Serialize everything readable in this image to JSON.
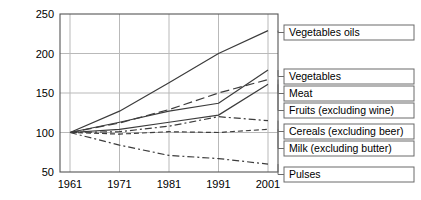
{
  "chart_data": {
    "type": "line",
    "title": "",
    "subtitle": "",
    "xlabel": "",
    "ylabel": "",
    "x": [
      1961,
      1971,
      1981,
      1991,
      2001
    ],
    "xtick_labels": [
      "1961",
      "1971",
      "1981",
      "1991",
      "2001"
    ],
    "xlim": [
      1961,
      2001
    ],
    "ylim": [
      50,
      250
    ],
    "ytick_labels": [
      "50",
      "100",
      "150",
      "200",
      "250"
    ],
    "yticks": [
      50,
      100,
      150,
      200,
      250
    ],
    "grid": true,
    "legend_position": "right-callout-boxes",
    "index_base": 100,
    "series": [
      {
        "name": "Vegetables oils",
        "label": "Vegetables oils",
        "values": [
          100,
          127,
          163,
          200,
          229
        ],
        "dash": "solid",
        "color": "#3c3c3c"
      },
      {
        "name": "Vegetables",
        "label": "Vegetables",
        "values": [
          100,
          113,
          127,
          137,
          179
        ],
        "dash": "solid",
        "color": "#3c3c3c"
      },
      {
        "name": "Meat",
        "label": "Meat",
        "values": [
          100,
          112,
          129,
          150,
          167
        ],
        "dash": "dashed-long",
        "color": "#3c3c3c"
      },
      {
        "name": "Fruits (excluding wine)",
        "label": "Fruits (excluding wine)",
        "values": [
          100,
          104,
          113,
          122,
          161
        ],
        "dash": "solid",
        "color": "#3c3c3c"
      },
      {
        "name": "Cereals (excluding beer)",
        "label": "Cereals (excluding beer)",
        "values": [
          100,
          101,
          108,
          120,
          115
        ],
        "dash": "dash-dot",
        "color": "#3c3c3c"
      },
      {
        "name": "Milk (excluding butter)",
        "label": "Milk (excluding butter)",
        "values": [
          100,
          98,
          101,
          100,
          104
        ],
        "dash": "dashed-short",
        "color": "#3c3c3c"
      },
      {
        "name": "Pulses",
        "label": "Pulses",
        "values": [
          100,
          84,
          71,
          67,
          60
        ],
        "dash": "dash-dot",
        "color": "#3c3c3c"
      }
    ],
    "legend_boxes": [
      {
        "label": "Vegetables oils",
        "series": "Vegetables oils",
        "y": 25
      },
      {
        "label": "Vegetables",
        "series": "Vegetables",
        "y": 69
      },
      {
        "label": "Meat",
        "series": "Meat",
        "y": 86
      },
      {
        "label": "Fruits (excluding wine)",
        "series": "Fruits (excluding wine)",
        "y": 103
      },
      {
        "label": "Cereals (excluding beer)",
        "series": "Cereals (excluding beer)",
        "y": 124
      },
      {
        "label": "Milk (excluding butter)",
        "series": "Milk (excluding butter)",
        "y": 141
      },
      {
        "label": "Pulses",
        "series": "Pulses",
        "y": 167
      }
    ],
    "style": {
      "axis_color": "#555555",
      "grid_color": "#b9b9b9",
      "line_color": "#3c3c3c",
      "legend_border_color": "#6a6a6a",
      "background": "#ffffff"
    }
  }
}
